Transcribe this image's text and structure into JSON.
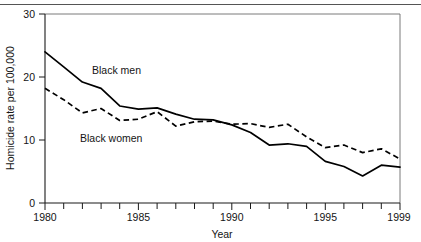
{
  "chart_data": {
    "type": "line",
    "title": "",
    "xlabel": "Year",
    "ylabel": "Homicide rate per 100,000",
    "xlim": [
      1980,
      1999
    ],
    "ylim": [
      0,
      30
    ],
    "grid": false,
    "legend_position": "inline-annotation",
    "x": [
      1980,
      1981,
      1982,
      1983,
      1984,
      1985,
      1986,
      1987,
      1988,
      1989,
      1990,
      1991,
      1992,
      1993,
      1994,
      1995,
      1996,
      1997,
      1998,
      1999
    ],
    "yticks": [
      0,
      10,
      20,
      30
    ],
    "ytick_labels": [
      "0",
      "10",
      "20",
      "30"
    ],
    "xticks": [
      1980,
      1985,
      1990,
      1995,
      1999
    ],
    "xtick_labels": [
      "1980",
      "1985",
      "1990",
      "1995",
      "1999"
    ],
    "xminor_ticks": [
      1981,
      1982,
      1983,
      1984,
      1986,
      1987,
      1988,
      1989,
      1991,
      1992,
      1993,
      1994,
      1996,
      1997,
      1998
    ],
    "series": [
      {
        "name": "Black men",
        "style": "solid",
        "color": "#000000",
        "label_text": "Black men",
        "values": [
          24.0,
          21.6,
          19.2,
          18.2,
          15.4,
          14.9,
          15.1,
          14.1,
          13.3,
          13.2,
          12.4,
          11.2,
          9.2,
          9.4,
          9.0,
          6.6,
          5.8,
          4.3,
          6.0,
          5.7
        ]
      },
      {
        "name": "Black women",
        "style": "dashed",
        "color": "#000000",
        "label_text": "Black women",
        "values": [
          18.2,
          16.4,
          14.3,
          15.0,
          13.1,
          13.3,
          14.5,
          12.2,
          12.9,
          13.0,
          12.5,
          12.6,
          12.0,
          12.5,
          10.5,
          8.8,
          9.2,
          8.0,
          8.6,
          7.0
        ]
      }
    ],
    "annotations": [
      {
        "name": "black-men-label",
        "text": "Black men",
        "x": 1985.0,
        "y": 20.5
      },
      {
        "name": "black-women-label",
        "text": "Black women",
        "x": 1984.6,
        "y": 11.8
      }
    ]
  }
}
